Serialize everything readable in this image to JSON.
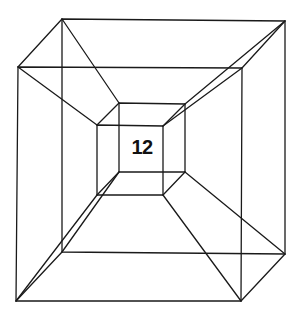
{
  "diagram": {
    "type": "wireframe-hypercube",
    "label": "12",
    "stroke_color": "#1a1a1a",
    "background": "#ffffff",
    "outer_back": [
      [
        62,
        19
      ],
      [
        285,
        21
      ],
      [
        285,
        254
      ],
      [
        62,
        252
      ]
    ],
    "outer_front": [
      [
        18,
        67
      ],
      [
        242,
        68
      ],
      [
        241,
        301
      ],
      [
        16,
        301
      ]
    ],
    "inner_back": [
      [
        119,
        103
      ],
      [
        185,
        104
      ],
      [
        185,
        172
      ],
      [
        119,
        172
      ]
    ],
    "inner_front": [
      [
        97,
        125
      ],
      [
        163,
        126
      ],
      [
        163,
        195
      ],
      [
        97,
        195
      ]
    ]
  }
}
